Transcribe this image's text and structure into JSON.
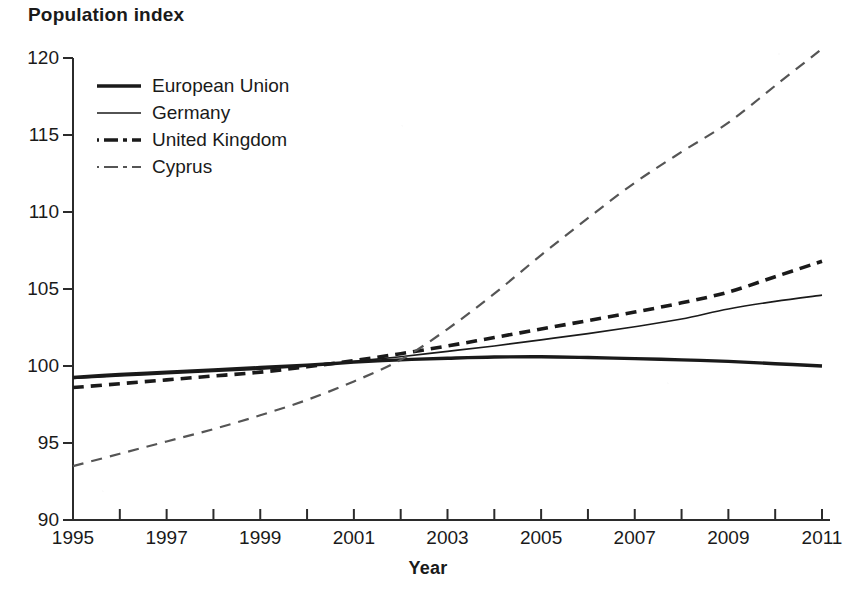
{
  "chart_data": {
    "type": "line",
    "title": "Population index",
    "xlabel": "Year",
    "ylabel": "Population index",
    "xlim": [
      1995,
      2011
    ],
    "ylim": [
      90,
      120
    ],
    "grid": false,
    "legend_position": "top-left",
    "y_ticks": [
      "120",
      "115",
      "110",
      "105",
      "100",
      "95",
      "90"
    ],
    "y_tick_values": [
      120,
      115,
      110,
      105,
      100,
      95,
      90
    ],
    "x_ticks": [
      "1995",
      "1997",
      "1999",
      "2001",
      "2003",
      "2005",
      "2007",
      "2009",
      "2011"
    ],
    "x_tick_values": [
      1995,
      1997,
      1999,
      2001,
      2003,
      2005,
      2007,
      2009,
      2011
    ],
    "x_minor_tick_values": [
      1996,
      1998,
      2000,
      2002,
      2004,
      2006,
      2008,
      2010
    ],
    "x": [
      1995,
      1996,
      1997,
      1998,
      1999,
      2000,
      2001,
      2002,
      2003,
      2004,
      2005,
      2006,
      2007,
      2008,
      2009,
      2010,
      2011
    ],
    "series": [
      {
        "name": "European Union",
        "style": "thick-solid",
        "color": "#1a1a1a",
        "values": [
          99.25,
          99.45,
          99.6,
          99.75,
          99.9,
          100.05,
          100.25,
          100.4,
          100.5,
          100.58,
          100.6,
          100.55,
          100.48,
          100.4,
          100.3,
          100.15,
          100.0
        ]
      },
      {
        "name": "Germany",
        "style": "thin-solid",
        "color": "#1a1a1a",
        "values": [
          99.2,
          99.35,
          99.5,
          99.65,
          99.8,
          100.0,
          100.3,
          100.6,
          100.95,
          101.3,
          101.7,
          102.1,
          102.55,
          103.05,
          103.7,
          104.2,
          104.6
        ]
      },
      {
        "name": "United Kingdom",
        "style": "thick-dashed",
        "color": "#1a1a1a",
        "values": [
          98.6,
          98.85,
          99.1,
          99.35,
          99.6,
          99.95,
          100.35,
          100.8,
          101.3,
          101.85,
          102.4,
          102.95,
          103.5,
          104.1,
          104.8,
          105.8,
          106.8
        ]
      },
      {
        "name": "Cyprus",
        "style": "thin-dashed",
        "color": "#555555",
        "values": [
          93.5,
          94.3,
          95.1,
          95.9,
          96.8,
          97.8,
          99.0,
          100.4,
          102.4,
          104.7,
          107.2,
          109.6,
          111.9,
          113.9,
          115.8,
          118.2,
          120.6
        ]
      }
    ]
  },
  "legend": {
    "items": [
      {
        "label": "European Union",
        "style": "thick-solid"
      },
      {
        "label": "Germany",
        "style": "thin-solid"
      },
      {
        "label": "United Kingdom",
        "style": "thick-dashed"
      },
      {
        "label": "Cyprus",
        "style": "thin-dashed"
      }
    ]
  }
}
